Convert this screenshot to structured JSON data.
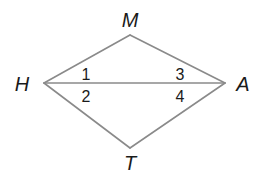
{
  "diagram": {
    "type": "geometry-quadrilateral",
    "stroke_color": "#8a8a8a",
    "vertices": [
      {
        "name": "H",
        "x": 44,
        "y": 83,
        "label_x": 22,
        "label_y": 91
      },
      {
        "name": "M",
        "x": 130,
        "y": 35,
        "label_x": 130,
        "label_y": 27
      },
      {
        "name": "A",
        "x": 225,
        "y": 83,
        "label_x": 243,
        "label_y": 91
      },
      {
        "name": "T",
        "x": 130,
        "y": 148,
        "label_x": 130,
        "label_y": 170
      }
    ],
    "segments": [
      [
        "H",
        "M"
      ],
      [
        "M",
        "A"
      ],
      [
        "A",
        "T"
      ],
      [
        "T",
        "H"
      ],
      [
        "H",
        "A"
      ]
    ],
    "angle_labels": [
      {
        "label": "1",
        "x": 86,
        "y": 80
      },
      {
        "label": "2",
        "x": 86,
        "y": 102
      },
      {
        "label": "3",
        "x": 180,
        "y": 80
      },
      {
        "label": "4",
        "x": 180,
        "y": 102
      }
    ]
  }
}
